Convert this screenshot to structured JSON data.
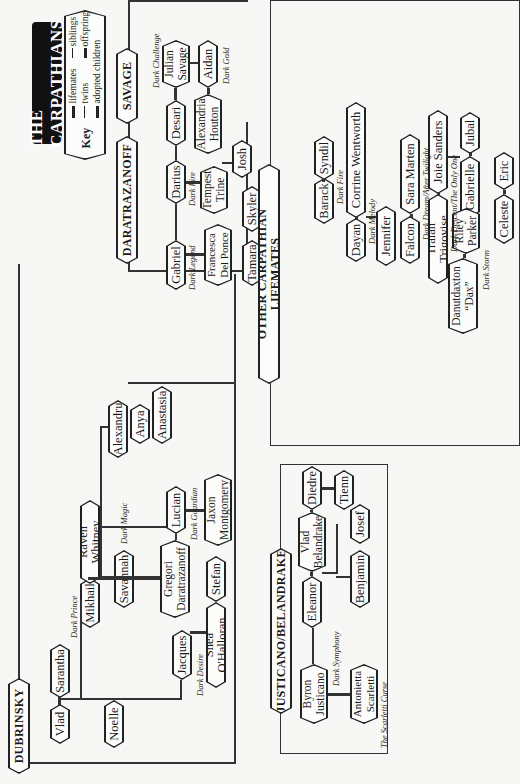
{
  "title": "THE CARPATHIANS",
  "key": {
    "label": "Key",
    "items": [
      {
        "symbol": "double-line",
        "label": "lifemates"
      },
      {
        "symbol": "twins-mark",
        "label": "twins"
      },
      {
        "symbol": "double-t",
        "label": "adopted children"
      },
      {
        "symbol": "single-line",
        "label": "siblings"
      },
      {
        "symbol": "t-mark",
        "label": "offspring"
      }
    ]
  },
  "families": {
    "daratrazanoff": "DARATRAZANOFF",
    "savage": "SAVAGE",
    "dubrinsky": "DUBRINSKY",
    "justicano": "JUSTICANO/BELANDRAKE",
    "other": "OTHER CARPATHIAN LIFEMATES"
  },
  "people": {
    "gabriel": "Gabriel",
    "francesca": "Francesca Del Ponce",
    "darius": "Darius",
    "tempest": "Tempest Trine",
    "desari": "Desari",
    "julian": "Julian Savage",
    "aidan": "Aidan",
    "alexandria": "Alexandria Houton",
    "josh": "Josh",
    "tamara": "Tamara",
    "skyler": "Skyler",
    "dimitri": "Dimitri Tirunul",
    "vlad": "Vlad",
    "sarantha": "Sarantha",
    "mikhail": "Mikhail",
    "raven": "Raven Whitney",
    "noelle": "Noelle",
    "savannah": "Savannah",
    "gregori": "Gregori Daratrazanoff",
    "jacques": "Jacques",
    "shea": "Shea O'Halloran",
    "stefan": "Stefan",
    "lucian": "Lucian",
    "jaxon": "Jaxon Montgomery",
    "alexandru": "Alexandru",
    "anya": "Anya",
    "anastasia": "Anastasia",
    "byron": "Byron Justicano",
    "antonietta": "Antonietta Scarletti",
    "eleanor": "Eleanor",
    "vladb": "Vlad Belandrake",
    "benjamin": "Benjamin",
    "josef": "Josef",
    "diedre": "Diedre",
    "tienn": "Tienn",
    "barack": "Barack",
    "syndil": "Syndil",
    "dayan": "Dayan",
    "corrine": "Corrine Wentworth",
    "jennifer": "Jennifer",
    "falcon": "Falcon",
    "sara": "Sara Marten",
    "traian": "Traian Trigovise",
    "joie": "Joie Sanders",
    "gabrielle": "Gabrielle",
    "jubal": "Jubal",
    "dax": "Danutdaxton “Dax”",
    "riley": "Riley Parker",
    "celeste": "Celeste",
    "eric": "Eric"
  },
  "books": {
    "dark_challenge": "Dark Challenge",
    "dark_gold": "Dark Gold",
    "dark_fire_darius": "Dark Fire",
    "dark_legend": "Dark Legend",
    "dark_wolf": "Dark Wolf",
    "dark_prince": "Dark Prince",
    "dark_magic": "Dark Magic",
    "dark_desire": "Dark Desire",
    "dark_guardian": "Dark Guardian",
    "dark_symphony": "Dark Symphony",
    "scarletti_curse": "The Scarletti Curse",
    "dark_fire_barack": "Dark Fire",
    "dark_melody": "Dark Melody",
    "dark_dream": "Dark Dream/After Twilight",
    "dark_descent": "Dark Descent/The Only One",
    "dark_storm": "Dark Storm"
  }
}
